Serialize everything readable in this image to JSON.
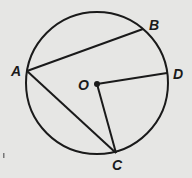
{
  "diagram": {
    "circle": {
      "cx": 97,
      "cy": 83,
      "r": 71
    },
    "center": {
      "label": "O",
      "x": 97,
      "y": 84
    },
    "points": [
      {
        "label": "A",
        "x": 27,
        "y": 71
      },
      {
        "label": "B",
        "x": 143,
        "y": 29
      },
      {
        "label": "C",
        "x": 116,
        "y": 153
      },
      {
        "label": "D",
        "x": 167,
        "y": 73
      }
    ],
    "segments": [
      {
        "from": "A",
        "to": "B"
      },
      {
        "from": "A",
        "to": "C"
      },
      {
        "from": "O",
        "to": "C"
      },
      {
        "from": "O",
        "to": "D"
      }
    ],
    "labels": {
      "A": "A",
      "B": "B",
      "C": "C",
      "D": "D",
      "O": "O"
    },
    "colors": {
      "stroke": "#1a1a1a",
      "background": "#e6e6e4"
    }
  }
}
